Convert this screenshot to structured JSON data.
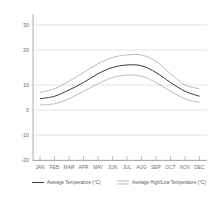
{
  "chart_data": {
    "type": "line",
    "title": "",
    "xlabel": "",
    "ylabel": "",
    "categories": [
      "JAN",
      "FEB",
      "MAR",
      "APR",
      "MAY",
      "JUN",
      "JUL",
      "AUG",
      "SEP",
      "OCT",
      "NOV",
      "DEC"
    ],
    "ylim": [
      -20,
      33
    ],
    "yticks": [
      -20,
      -10,
      0,
      10,
      20,
      30
    ],
    "ytick_labels": [
      "-20",
      "-10",
      "0",
      "10",
      "20",
      "30"
    ],
    "grid": true,
    "legend_position": "bottom",
    "series": [
      {
        "name": "Average Temperature (°C)",
        "color": "#3a3a3a",
        "style": "solid-dark",
        "values": [
          4.5,
          5.5,
          8.0,
          11.0,
          14.5,
          17.0,
          18.0,
          17.7,
          15.0,
          11.0,
          7.5,
          5.5
        ]
      },
      {
        "name": "Average High Temperature (°C)",
        "color": "#b4b4b4",
        "style": "solid-light",
        "values": [
          7.0,
          8.5,
          11.5,
          15.0,
          18.5,
          21.0,
          22.0,
          22.0,
          19.5,
          14.5,
          10.0,
          8.5
        ]
      },
      {
        "name": "Average Low Temperature (°C)",
        "color": "#b4b4b4",
        "style": "solid-light",
        "values": [
          2.0,
          2.5,
          4.5,
          7.5,
          10.5,
          13.0,
          14.0,
          13.5,
          11.0,
          7.5,
          4.5,
          3.0
        ]
      }
    ],
    "legend": [
      {
        "label": "Average Temperature (°C)",
        "color": "#3a3a3a",
        "swatch": "single-line"
      },
      {
        "label": "Average High/Low Temperature (°C)",
        "color": "#b4b4b4",
        "swatch": "double-line"
      }
    ]
  },
  "axes": {
    "y_tick_0": "30",
    "y_tick_1": "20",
    "y_tick_2": "10",
    "y_tick_3": "0",
    "y_tick_4": "-10",
    "y_tick_5": "-20",
    "x_tick_0": "JAN",
    "x_tick_1": "FEB",
    "x_tick_2": "MAR",
    "x_tick_3": "APR",
    "x_tick_4": "MAY",
    "x_tick_5": "JUN",
    "x_tick_6": "JUL",
    "x_tick_7": "AUG",
    "x_tick_8": "SEP",
    "x_tick_9": "OCT",
    "x_tick_10": "NOV",
    "x_tick_11": "DEC"
  },
  "legend_text": {
    "entry_0": "Average Temperature (°C)",
    "entry_1": "Average High/Low Temperature (°C)"
  },
  "colors": {
    "background": "#ffffff",
    "grid": "#d2d2d2",
    "axis": "#9a9a9a",
    "avg_line": "#3a3a3a",
    "band_line": "#b4b4b4",
    "text": "#6e6e6e"
  }
}
